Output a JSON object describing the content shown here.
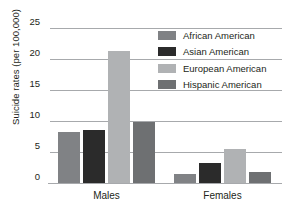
{
  "chart_data": {
    "type": "bar",
    "title": "",
    "xlabel": "",
    "ylabel": "Suicide rates (per 100,000)",
    "categories": [
      "Males",
      "Females"
    ],
    "ylim": [
      0,
      25
    ],
    "yticks": [
      0,
      5,
      10,
      15,
      20,
      25
    ],
    "ytick_labels": [
      "0",
      "5",
      "10",
      "15",
      "20",
      "25"
    ],
    "grid": true,
    "legend_position": "upper right",
    "series": [
      {
        "name": "African American",
        "color": "#808285",
        "values": [
          8.3,
          1.5
        ]
      },
      {
        "name": "Asian American",
        "color": "#2b2b2b",
        "values": [
          8.5,
          3.3
        ]
      },
      {
        "name": "European American",
        "color": "#b0b2b4",
        "values": [
          21.3,
          5.5
        ]
      },
      {
        "name": "Hispanic American",
        "color": "#6e7072",
        "values": [
          9.8,
          1.8
        ]
      }
    ]
  },
  "axis": {
    "y_title": "Suicide rates (per 100,000)",
    "ticks": [
      "25",
      "20",
      "15",
      "10",
      "5",
      "0"
    ]
  },
  "groups": [
    {
      "label": "Males"
    },
    {
      "label": "Females"
    }
  ],
  "legend": {
    "items": [
      {
        "label": "African American",
        "color": "#808285"
      },
      {
        "label": "Asian American",
        "color": "#2b2b2b"
      },
      {
        "label": "European American",
        "color": "#b0b2b4"
      },
      {
        "label": "Hispanic American",
        "color": "#6e7072"
      }
    ]
  }
}
